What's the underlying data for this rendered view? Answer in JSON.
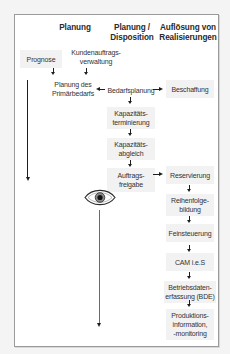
{
  "headers": {
    "col1": "Planung",
    "col2_line1": "Planung /",
    "col2_line2": "Disposition",
    "col3_line1": "Auflösung von",
    "col3_line2": "Realisierungen"
  },
  "nodes": {
    "prognose": "Prognose",
    "kundenauftrag_l1": "Kundenauftrags-",
    "kundenauftrag_l2": "verwaltung",
    "primaerbedarf_l1": "Planung des",
    "primaerbedarf_l2": "Primärbedarfs",
    "bedarfsplanung": "Bedarfsplanung",
    "beschaffung": "Beschaffung",
    "kapterm_l1": "Kapazitäts-",
    "kapterm_l2": "terminierung",
    "kapabgl_l1": "Kapazitäts-",
    "kapabgl_l2": "abgleich",
    "freigabe_l1": "Auftrags-",
    "freigabe_l2": "freigabe",
    "reservierung": "Reservierung",
    "reihenfolge_l1": "Reihenfolge-",
    "reihenfolge_l2": "bildung",
    "feinsteuerung": "Feinsteuerung",
    "cam": "CAM i.e.S",
    "bde_l1": "Betriebsdaten-",
    "bde_l2": "erfassung (BDE)",
    "produktion_l1": "Produktions-",
    "produktion_l2": "information,",
    "produktion_l3": "-monitoring"
  },
  "icons": {
    "eye": "eye-icon"
  },
  "colors": {
    "frame_border": "#9a9a9a",
    "box_fill": "#f2f2f2",
    "arrow": "#1e1e1e",
    "eye_line": "#6a6a6a"
  }
}
